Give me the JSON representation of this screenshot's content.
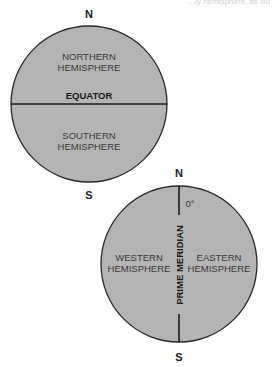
{
  "top_text_fragment": "…ly hemisphere, as illu",
  "colors": {
    "globe_fill": "#b4b4b4",
    "outline": "#2a2a2a",
    "text": "#3a3a3a"
  },
  "globe_equator": {
    "north_label": "N",
    "south_label": "S",
    "upper_region": [
      "NORTHERN",
      "HEMISPHERE"
    ],
    "lower_region": [
      "SOUTHERN",
      "HEMISPHERE"
    ],
    "line_label": "EQUATOR"
  },
  "globe_meridian": {
    "north_label": "N",
    "south_label": "S",
    "degree_label": "0°",
    "left_region": [
      "WESTERN",
      "HEMISPHERE"
    ],
    "right_region": [
      "EASTERN",
      "HEMISPHERE"
    ],
    "line_label": "PRIME MERIDIAN"
  }
}
